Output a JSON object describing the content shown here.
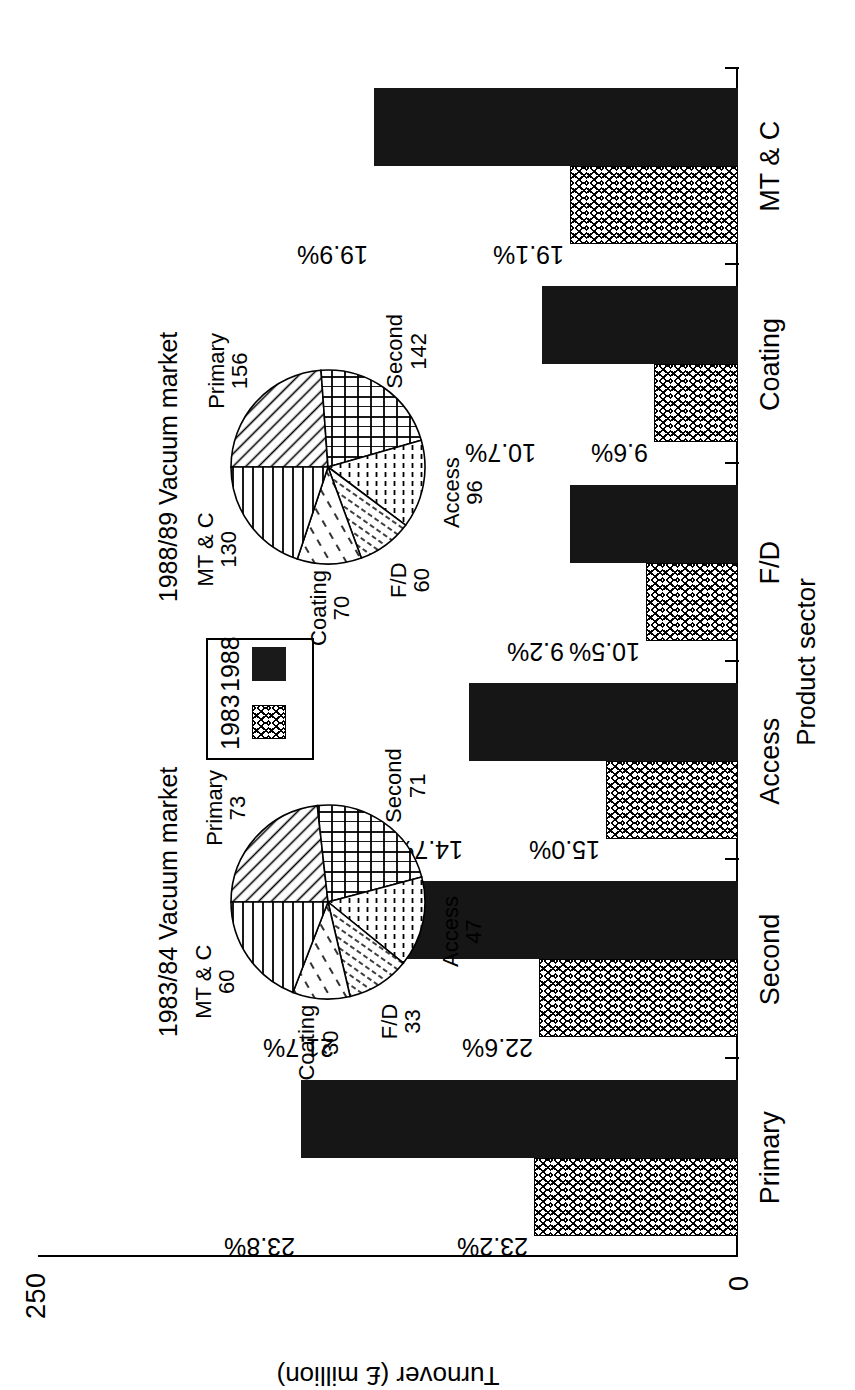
{
  "chart_data": {
    "type": "bar",
    "title": "",
    "xlabel": "Product sector",
    "ylabel": "Turnover (£ million)",
    "ylim": [
      0,
      250
    ],
    "y_ticks": [
      "0",
      "250"
    ],
    "grid": false,
    "legend_position": "center",
    "categories": [
      "Primary",
      "Second",
      "Access",
      "F/D",
      "Coating",
      "MT & C"
    ],
    "series": [
      {
        "name": "1983",
        "values": [
          73,
          71,
          47,
          33,
          30,
          60
        ],
        "labels": [
          "23.2%",
          "22.6%",
          "15.0%",
          "10.5%",
          "9.6%",
          "19.1%"
        ],
        "fill": "hatched-crosshatch",
        "color": "#ffffff"
      },
      {
        "name": "1988",
        "values": [
          156,
          142,
          96,
          60,
          70,
          130
        ],
        "labels": [
          "23.8%",
          "21.7%",
          "14.7%",
          "9.2%",
          "10.7%",
          "19.9%"
        ],
        "fill": "solid",
        "color": "#161616"
      }
    ]
  },
  "pies": [
    {
      "title": "1983/84 Vacuum market",
      "type": "pie",
      "slices": [
        {
          "label": "Primary",
          "value": 73,
          "pattern": "diagonal-lines"
        },
        {
          "label": "Second",
          "value": 71,
          "pattern": "brick"
        },
        {
          "label": "Access",
          "value": 47,
          "pattern": "dotted-dash"
        },
        {
          "label": "F/D",
          "value": 33,
          "pattern": "fine-diagonal"
        },
        {
          "label": "Coating",
          "value": 30,
          "pattern": "sparse-dash"
        },
        {
          "label": "MT & C",
          "value": 60,
          "pattern": "horizontal-lines"
        }
      ]
    },
    {
      "title": "1988/89 Vacuum market",
      "type": "pie",
      "slices": [
        {
          "label": "Primary",
          "value": 156,
          "pattern": "diagonal-lines"
        },
        {
          "label": "Second",
          "value": 142,
          "pattern": "brick"
        },
        {
          "label": "Access",
          "value": 96,
          "pattern": "dotted-dash"
        },
        {
          "label": "F/D",
          "value": 60,
          "pattern": "fine-diagonal"
        },
        {
          "label": "Coating",
          "value": 70,
          "pattern": "sparse-dash"
        },
        {
          "label": "MT & C",
          "value": 130,
          "pattern": "horizontal-lines"
        }
      ]
    }
  ],
  "legend": {
    "entries": [
      {
        "label": "1983",
        "swatch": "hatched"
      },
      {
        "label": "1988",
        "swatch": "solid-black"
      }
    ]
  }
}
